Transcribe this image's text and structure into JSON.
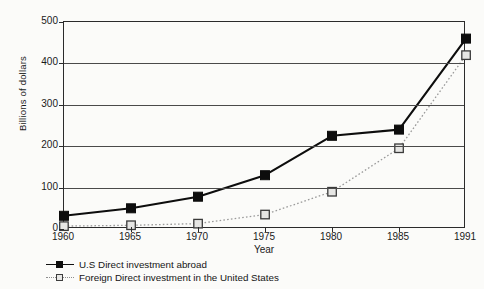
{
  "chart_data": {
    "type": "line",
    "title": "",
    "xlabel": "Year",
    "ylabel": "Billions of dollars",
    "categories": [
      "1960",
      "1965",
      "1970",
      "1975",
      "1980",
      "1985",
      "1991"
    ],
    "x": [
      1960,
      1965,
      1970,
      1975,
      1980,
      1985,
      1991
    ],
    "ylim": [
      0,
      500
    ],
    "yticks": [
      0,
      100,
      200,
      300,
      400,
      500
    ],
    "ytick_labels": [
      "0",
      "100",
      "200",
      "300",
      "400",
      "500"
    ],
    "grid": true,
    "legend_position": "below-left",
    "series": [
      {
        "name": "U.S Direct investment abroad",
        "marker": "filled-square",
        "line_style": "solid",
        "color": "#0d0d0d",
        "values": [
          32,
          50,
          78,
          130,
          225,
          240,
          460
        ]
      },
      {
        "name": "Foreign Direct investment in the United States",
        "marker": "open-square",
        "line_style": "dotted",
        "color": "#9a9a9a",
        "values": [
          7,
          9,
          13,
          35,
          90,
          195,
          420
        ]
      }
    ]
  },
  "legend": {
    "items": [
      {
        "label": "U.S Direct investment abroad"
      },
      {
        "label": "Foreign Direct investment in the United States"
      }
    ]
  }
}
